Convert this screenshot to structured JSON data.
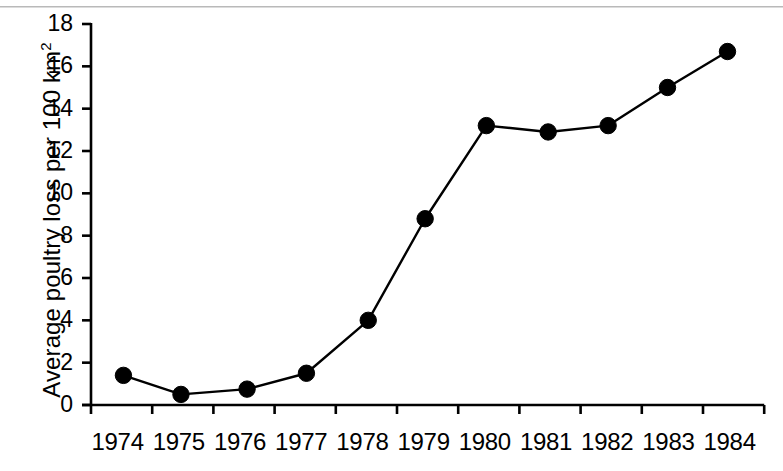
{
  "chart_data": {
    "type": "line",
    "title": "",
    "xlabel": "",
    "ylabel": "Average poultry loss per 100 km²",
    "ylabel_base": "Average poultry loss per 100 km",
    "ylabel_sup": "2",
    "categories": [
      "1974",
      "1975",
      "1976",
      "1977",
      "1978",
      "1979",
      "1980",
      "1981",
      "1982",
      "1983",
      "1984"
    ],
    "x": [
      1974,
      1975,
      1976,
      1977,
      1978,
      1979,
      1980,
      1981,
      1982,
      1983,
      1984
    ],
    "values": [
      1.4,
      0.5,
      0.75,
      1.5,
      4.0,
      8.8,
      13.2,
      12.9,
      13.2,
      15.0,
      16.7
    ],
    "series": [
      {
        "name": "Average poultry loss per 100 km2",
        "values": [
          1.4,
          0.5,
          0.75,
          1.5,
          4.0,
          8.8,
          13.2,
          12.9,
          13.2,
          15.0,
          16.7
        ]
      }
    ],
    "point_x_offset_years": [
      0.53,
      1.47,
      2.55,
      3.52,
      4.53,
      5.46,
      6.46,
      7.47,
      8.45,
      9.42,
      10.4
    ],
    "ylim": [
      0,
      18
    ],
    "yticks": [
      0,
      2,
      4,
      6,
      8,
      10,
      12,
      14,
      16,
      18
    ],
    "ytick_labels": [
      "0",
      "2",
      "4",
      "6",
      "8",
      "10",
      "12",
      "14",
      "16",
      "18"
    ],
    "xtick_labels": [
      "1974",
      "1975",
      "1976",
      "1977",
      "1978",
      "1979",
      "1980",
      "1981",
      "1982",
      "1983",
      "1984"
    ],
    "grid": false,
    "legend": "none",
    "marker": "filled-circle",
    "marker_color": "#000000",
    "line_color": "#000000",
    "axis_color": "#000000",
    "background_color": "#ffffff"
  },
  "figure": {
    "width": 783,
    "height": 471
  }
}
